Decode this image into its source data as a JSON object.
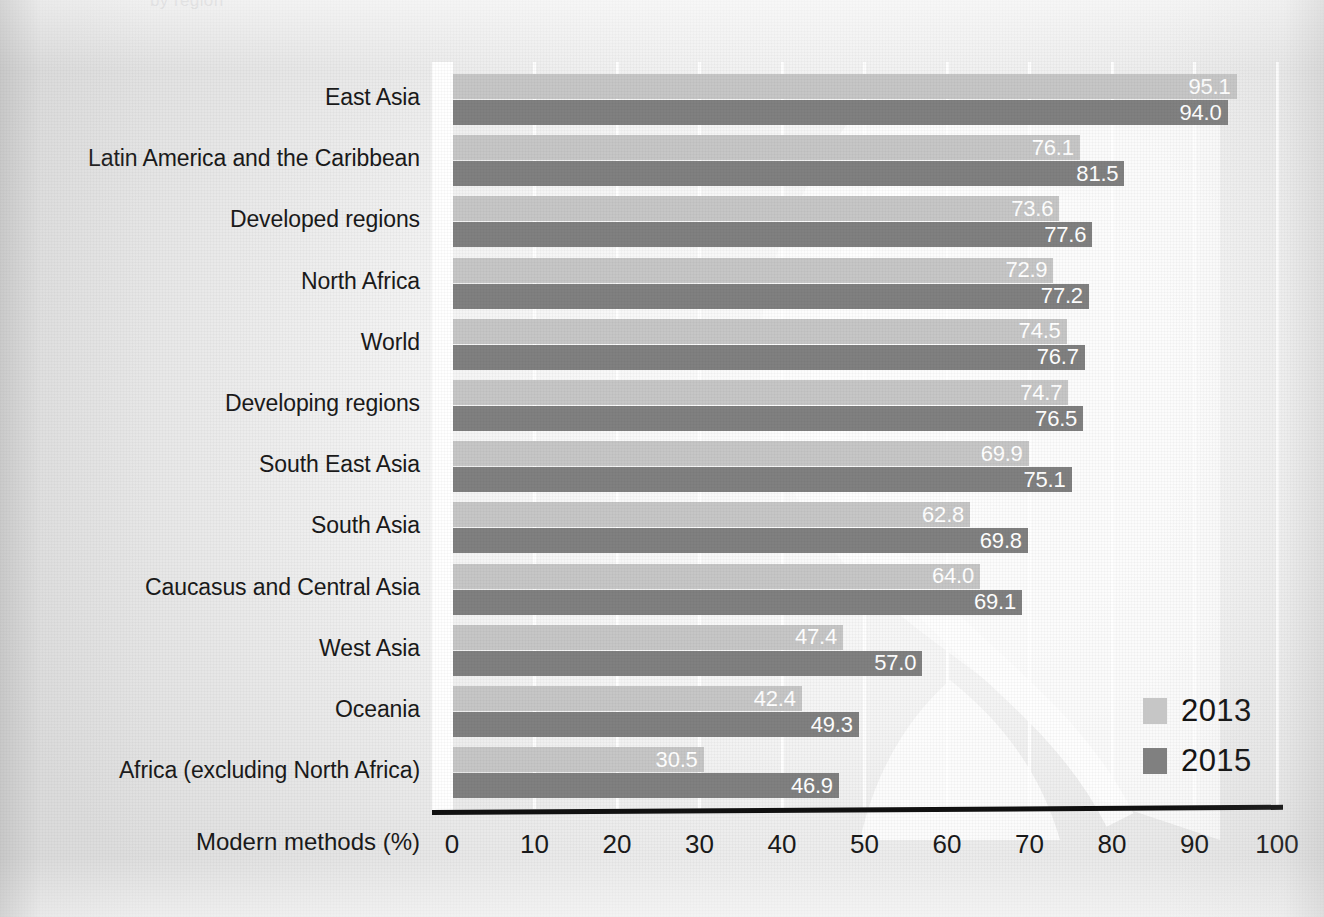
{
  "page": {
    "cropped_heading": "by region"
  },
  "legend": {
    "position": "bottom-right",
    "items": [
      {
        "label": "2013",
        "color": "#c6c6c6"
      },
      {
        "label": "2015",
        "color": "#808080"
      }
    ]
  },
  "axis": {
    "title": "Modern methods (%)",
    "ticks": [
      "0",
      "10",
      "20",
      "30",
      "40",
      "50",
      "60",
      "70",
      "80",
      "90",
      "100"
    ]
  },
  "chart_data": {
    "type": "bar",
    "orientation": "horizontal",
    "title": "",
    "subtitle": "",
    "xlabel": "Modern methods (%)",
    "ylabel": "",
    "xlim": [
      0,
      100
    ],
    "xticks": [
      0,
      10,
      20,
      30,
      40,
      50,
      60,
      70,
      80,
      90,
      100
    ],
    "grid": true,
    "legend_position": "bottom-right",
    "categories": [
      "East Asia",
      "Latin America and the Caribbean",
      "Developed regions",
      "North Africa",
      "World",
      "Developing regions",
      "South East Asia",
      "South Asia",
      "Caucasus and Central Asia",
      "West Asia",
      "Oceania",
      "Africa (excluding North Africa)"
    ],
    "series": [
      {
        "name": "2013",
        "color": "#c6c6c6",
        "values": [
          95.1,
          76.1,
          73.6,
          72.9,
          74.5,
          74.7,
          69.9,
          62.8,
          64.0,
          47.4,
          42.4,
          30.5
        ],
        "labels": [
          "95.1",
          "76.1",
          "73.6",
          "72.9",
          "74.5",
          "74.7",
          "69.9",
          "62.8",
          "64.0",
          "47.4",
          "42.4",
          "30.5"
        ]
      },
      {
        "name": "2015",
        "color": "#808080",
        "values": [
          94.0,
          81.5,
          77.6,
          77.2,
          76.7,
          76.5,
          75.1,
          69.8,
          69.1,
          57.0,
          49.3,
          46.9
        ],
        "labels": [
          "94.0",
          "81.5",
          "77.6",
          "77.2",
          "76.7",
          "76.5",
          "75.1",
          "69.8",
          "69.1",
          "57.0",
          "49.3",
          "46.9"
        ]
      }
    ]
  }
}
